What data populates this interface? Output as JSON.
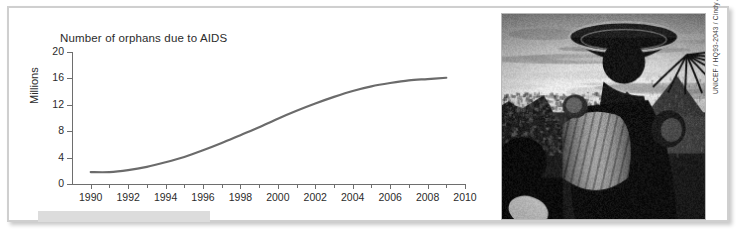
{
  "figure": {
    "background_color": "#ffffff",
    "frame_color": "#cfcfcf"
  },
  "chart_data": {
    "type": "line",
    "title": "Number of orphans due to AIDS",
    "xlabel": "",
    "ylabel": "Millions",
    "xlim": [
      1989,
      2010
    ],
    "ylim": [
      0,
      20
    ],
    "grid": false,
    "legend": null,
    "line_color": "#6b6b6b",
    "y_ticks": [
      0,
      4,
      8,
      12,
      16,
      20
    ],
    "y_tick_labels": [
      "0",
      "4",
      "8",
      "12",
      "16",
      "20"
    ],
    "x_ticks": [
      1990,
      1992,
      1994,
      1996,
      1998,
      2000,
      2002,
      2004,
      2006,
      2008,
      2010
    ],
    "x_tick_labels": [
      "1990",
      "1992",
      "1994",
      "1996",
      "1998",
      "2000",
      "2002",
      "2004",
      "2006",
      "2008",
      "2010"
    ],
    "x_minor_ticks": [
      1991,
      1993,
      1995,
      1997,
      1999,
      2001,
      2003,
      2005,
      2007,
      2009
    ],
    "x": [
      1990,
      1991,
      1992,
      1993,
      1994,
      1995,
      1996,
      1997,
      1998,
      1999,
      2000,
      2001,
      2002,
      2003,
      2004,
      2005,
      2006,
      2007,
      2008,
      2009
    ],
    "values": [
      1.8,
      1.8,
      2.1,
      2.6,
      3.3,
      4.1,
      5.1,
      6.2,
      7.4,
      8.6,
      9.9,
      11.1,
      12.2,
      13.2,
      14.1,
      14.8,
      15.3,
      15.7,
      15.9,
      16.1
    ],
    "series": [
      {
        "name": "Number of orphans due to AIDS",
        "values": [
          1.8,
          1.8,
          2.1,
          2.6,
          3.3,
          4.1,
          5.1,
          6.2,
          7.4,
          8.6,
          9.9,
          11.1,
          12.2,
          13.2,
          14.1,
          14.8,
          15.3,
          15.7,
          15.9,
          16.1
        ]
      }
    ]
  },
  "photo": {
    "name": "woman-carrying-basin-with-child",
    "credit": "UNICEF / HQ93-2043 / Cindy Andrew",
    "description": "Black-and-white photograph of a woman carrying a large basin on her head with a child on her back, village background"
  },
  "caption_strip": {
    "label": ""
  }
}
